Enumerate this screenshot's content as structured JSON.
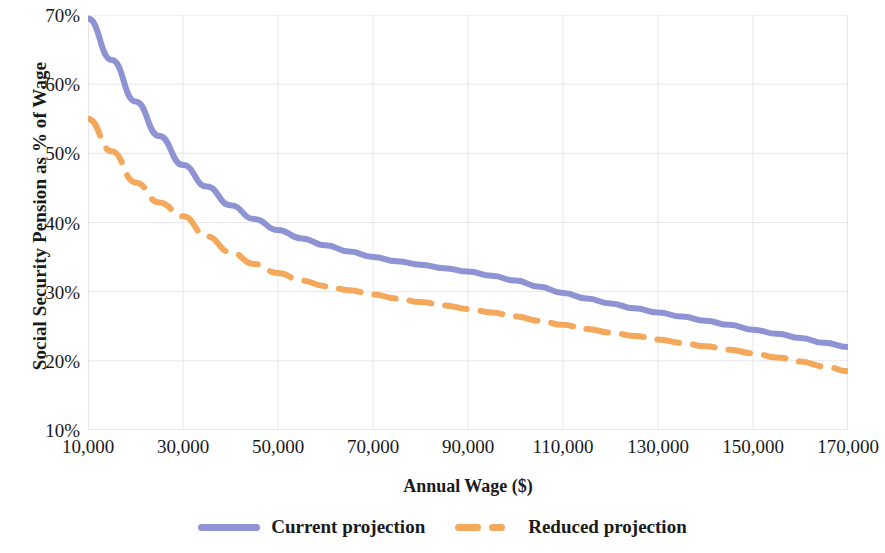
{
  "chart_data": {
    "type": "line",
    "title": "",
    "xlabel": "Annual Wage ($)",
    "ylabel": "Social Security Pension as % of Wage",
    "xlim": [
      10000,
      170000
    ],
    "ylim": [
      10,
      70
    ],
    "grid": true,
    "legend_position": "bottom",
    "x_tick_labels": [
      "10,000",
      "30,000",
      "50,000",
      "70,000",
      "90,000",
      "110,000",
      "130,000",
      "150,000",
      "170,000"
    ],
    "x_ticks": [
      10000,
      30000,
      50000,
      70000,
      90000,
      110000,
      130000,
      150000,
      170000
    ],
    "y_tick_labels": [
      "10%",
      "20%",
      "30%",
      "40%",
      "50%",
      "60%",
      "70%"
    ],
    "y_ticks": [
      10,
      20,
      30,
      40,
      50,
      60,
      70
    ],
    "x": [
      10000,
      15000,
      20000,
      25000,
      30000,
      35000,
      40000,
      45000,
      50000,
      55000,
      60000,
      65000,
      70000,
      75000,
      80000,
      85000,
      90000,
      95000,
      100000,
      105000,
      110000,
      115000,
      120000,
      125000,
      130000,
      135000,
      140000,
      145000,
      150000,
      155000,
      160000,
      165000,
      170000
    ],
    "series": [
      {
        "name": "Current projection",
        "color": "#8d93d3",
        "style": "solid",
        "width": 6,
        "values": [
          69.5,
          63.5,
          57.5,
          52.5,
          48.3,
          45.2,
          42.5,
          40.5,
          38.9,
          37.7,
          36.7,
          35.8,
          35.0,
          34.4,
          33.9,
          33.4,
          32.9,
          32.3,
          31.6,
          30.7,
          29.8,
          29.0,
          28.3,
          27.6,
          27.0,
          26.4,
          25.8,
          25.2,
          24.5,
          23.9,
          23.3,
          22.6,
          22.0
        ]
      },
      {
        "name": "Reduced projection",
        "color": "#f4a85b",
        "style": "dashed",
        "width": 6,
        "values": [
          55.0,
          50.3,
          45.8,
          42.9,
          40.9,
          38.0,
          35.7,
          34.0,
          32.7,
          31.6,
          30.8,
          30.2,
          29.6,
          29.0,
          28.5,
          28.0,
          27.5,
          27.0,
          26.4,
          25.8,
          25.2,
          24.6,
          24.1,
          23.6,
          23.1,
          22.6,
          22.1,
          21.6,
          21.1,
          20.5,
          19.9,
          19.2,
          18.5
        ]
      }
    ],
    "legend": [
      {
        "label": "Current projection",
        "color": "#8d93d3",
        "style": "solid"
      },
      {
        "label": "Reduced projection",
        "color": "#f4a85b",
        "style": "dashed"
      }
    ],
    "grid_color": "#e6e6ec",
    "axis_color": "#d8d8df"
  }
}
